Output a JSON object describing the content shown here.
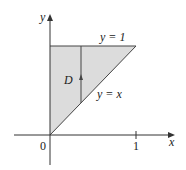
{
  "figure": {
    "region_label": "D",
    "top_boundary_label": "y = 1",
    "diagonal_boundary_label": "y = x",
    "x_axis_label": "x",
    "y_axis_label": "y",
    "origin_label": "0",
    "x_tick_label": "1"
  },
  "colors": {
    "region_fill": "#dcdcdc",
    "lines": "#333333"
  }
}
